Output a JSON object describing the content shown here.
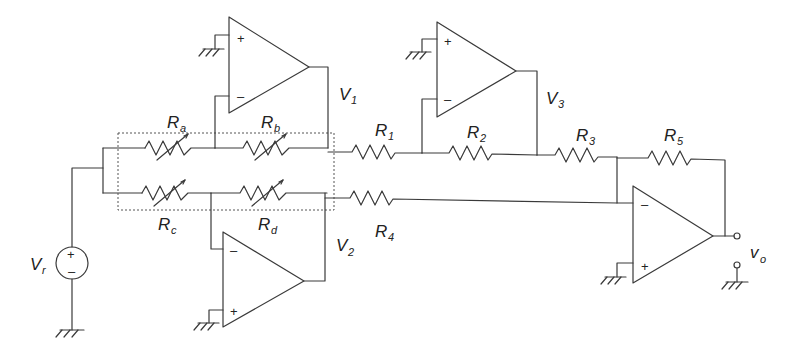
{
  "diagram": {
    "type": "circuit-schematic",
    "source": {
      "label": "V",
      "subscript": "r",
      "plus": "+",
      "minus": "–"
    },
    "variable_resistors": [
      {
        "label": "R",
        "subscript": "a"
      },
      {
        "label": "R",
        "subscript": "b"
      },
      {
        "label": "R",
        "subscript": "c"
      },
      {
        "label": "R",
        "subscript": "d"
      }
    ],
    "resistors": [
      {
        "label": "R",
        "subscript": "1"
      },
      {
        "label": "R",
        "subscript": "2"
      },
      {
        "label": "R",
        "subscript": "3"
      },
      {
        "label": "R",
        "subscript": "4"
      },
      {
        "label": "R",
        "subscript": "5"
      }
    ],
    "nodes": [
      {
        "label": "V",
        "subscript": "1"
      },
      {
        "label": "V",
        "subscript": "2"
      },
      {
        "label": "V",
        "subscript": "3"
      }
    ],
    "output": {
      "label": "v",
      "subscript": "o"
    },
    "opamps": [
      {
        "id": "top-left",
        "plus": "+",
        "minus": "–"
      },
      {
        "id": "top-right",
        "plus": "+",
        "minus": "–"
      },
      {
        "id": "bottom-left",
        "plus": "+",
        "minus": "–"
      },
      {
        "id": "output",
        "plus": "+",
        "minus": "–"
      }
    ]
  }
}
